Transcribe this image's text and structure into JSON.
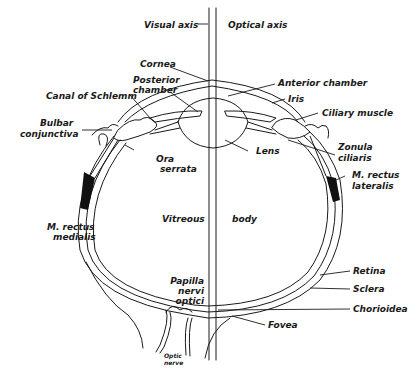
{
  "diagram": {
    "colors": {
      "ink": "#1a1a1a",
      "background": "#ffffff"
    },
    "labels": {
      "visual_axis": "Visual axis",
      "optical_axis": "Optical axis",
      "cornea": "Cornea",
      "posterior_chamber_1": "Posterior",
      "posterior_chamber_2": "chamber",
      "canal_of_schlemm": "Canal of Schlemm",
      "bulbar_conjunctiva_1": "Bulbar",
      "bulbar_conjunctiva_2": "conjunctiva",
      "ora_serrata_1": "Ora",
      "ora_serrata_2": "serrata",
      "m_rectus_medialis_1": "M. rectus",
      "m_rectus_medialis_2": "medialis",
      "vitreous": "Vitreous",
      "body": "body",
      "papilla_1": "Papilla",
      "papilla_2": "nervi",
      "papilla_3": "optici",
      "optic_nerve_1": "Optic",
      "optic_nerve_2": "nerve",
      "anterior_chamber": "Anterior chamber",
      "iris": "Iris",
      "ciliary_muscle": "Ciliary muscle",
      "lens": "Lens",
      "zonula_ciliaris_1": "Zonula",
      "zonula_ciliaris_2": "ciliaris",
      "m_rectus_lateralis_1": "M. rectus",
      "m_rectus_lateralis_2": "lateralis",
      "retina": "Retina",
      "sclera": "Sclera",
      "chorioidea": "Chorioidea",
      "fovea": "Fovea"
    }
  }
}
